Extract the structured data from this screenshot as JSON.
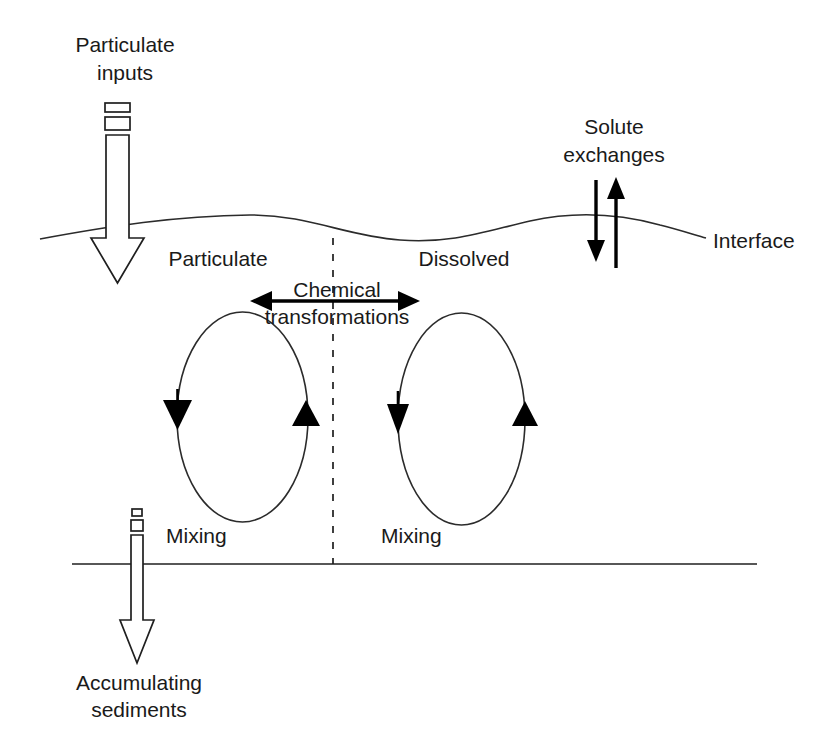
{
  "diagram": {
    "background_color": "#ffffff",
    "line_color": "#1f1f1f",
    "text_color": "#1a1a1a",
    "labels": {
      "particulate_inputs_line1": "Particulate",
      "particulate_inputs_line2": "inputs",
      "solute_exchanges_line1": "Solute",
      "solute_exchanges_line2": "exchanges",
      "interface": "Interface",
      "particulate": "Particulate",
      "dissolved": "Dissolved",
      "chemical_line1": "Chemical",
      "chemical_line2": "transformations",
      "mixing_left": "Mixing",
      "mixing_right": "Mixing",
      "accumulating_line1": "Accumulating",
      "accumulating_line2": "sediments"
    },
    "elements": {
      "particulate_inputs_arrow": "hollow-down-arrow",
      "solute_down_arrow": "down-arrow",
      "solute_up_arrow": "up-arrow",
      "interface_curve": "wavy-horizontal-line",
      "vertical_divider": "dashed-vertical-line",
      "chemical_arrow": "double-headed-horizontal-arrow",
      "mixing_loop_left": "ellipse-circulation-loop",
      "mixing_loop_right": "ellipse-circulation-loop",
      "sediment_line": "horizontal-line",
      "accumulating_sediments_arrow": "hollow-down-arrow"
    }
  }
}
